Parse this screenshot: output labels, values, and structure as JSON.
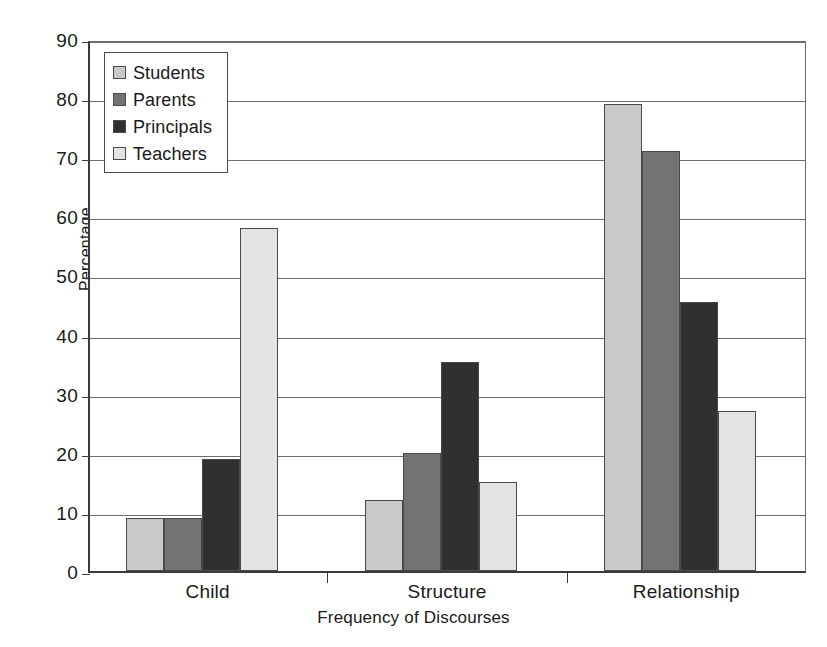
{
  "chart_data": {
    "type": "bar",
    "title": "",
    "xlabel": "Frequency of Discourses",
    "ylabel": "Percentage",
    "categories": [
      "Child",
      "Structure",
      "Relationship"
    ],
    "series": [
      {
        "name": "Students",
        "values": [
          9,
          12,
          79
        ],
        "color": "#c9c9c9"
      },
      {
        "name": "Parents",
        "values": [
          9,
          20,
          71
        ],
        "color": "#737373"
      },
      {
        "name": "Principals",
        "values": [
          19,
          35.3,
          45.5
        ],
        "color": "#303030"
      },
      {
        "name": "Teachers",
        "values": [
          58,
          15,
          27
        ],
        "color": "#e3e3e3"
      }
    ],
    "ylim": [
      0,
      90
    ],
    "yticks": [
      0,
      10,
      20,
      30,
      40,
      50,
      60,
      70,
      80,
      90
    ],
    "ytick_labels": [
      "0",
      "10",
      "20",
      "30",
      "40",
      "50",
      "60",
      "70",
      "80",
      "90"
    ],
    "grid": true,
    "legend_position": "upper-left"
  }
}
